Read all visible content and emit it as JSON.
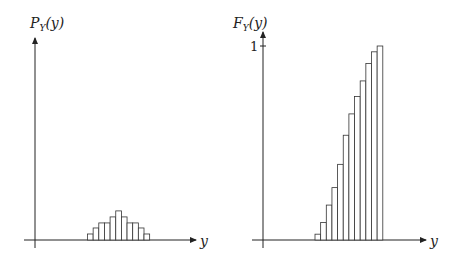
{
  "chart_data": [
    {
      "type": "bar",
      "title": "",
      "ylabel": "P_Y(y)",
      "xlabel": "y",
      "grid": false,
      "legend": null,
      "categories": [
        1,
        2,
        3,
        4,
        5,
        6,
        7,
        8,
        9,
        10,
        11
      ],
      "values": [
        0.031,
        0.062,
        0.088,
        0.088,
        0.119,
        0.15,
        0.119,
        0.088,
        0.088,
        0.062,
        0.031
      ],
      "ylim": [
        0,
        1
      ]
    },
    {
      "type": "bar",
      "title": "",
      "ylabel": "F_Y(y)",
      "xlabel": "y",
      "grid": false,
      "legend": null,
      "yticks": [
        "1"
      ],
      "categories": [
        1,
        2,
        3,
        4,
        5,
        6,
        7,
        8,
        9,
        10,
        11,
        12
      ],
      "values": [
        0.03,
        0.09,
        0.18,
        0.27,
        0.39,
        0.54,
        0.65,
        0.74,
        0.82,
        0.91,
        0.97,
        1.0
      ],
      "ylim": [
        0,
        1
      ]
    }
  ],
  "labels": {
    "left_y": "P",
    "left_y_sub": "Y",
    "left_y_arg": "(y)",
    "right_y": "F",
    "right_y_sub": "Y",
    "right_y_arg": "(y)",
    "x": "y",
    "tick_one": "1"
  }
}
